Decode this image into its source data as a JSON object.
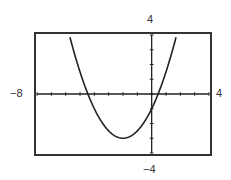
{
  "chart_data": {
    "type": "line",
    "title": "",
    "xlabel": "",
    "ylabel": "",
    "xlim": [
      -8,
      4
    ],
    "ylim": [
      -4,
      4
    ],
    "xscale_tick": 1,
    "yscale_tick": 1,
    "grid": false,
    "legend": null,
    "window_labels": {
      "ymax": "4",
      "ymin": "-4",
      "xmin": "-8",
      "xmax": "4"
    },
    "series": [
      {
        "name": "parabola",
        "equation_estimate": "y = 0.5x^2 + 2x - 1",
        "vertex": [
          -2,
          -3
        ],
        "x_intercepts": [
          -4.45,
          0.45
        ],
        "y_intercept": -1
      }
    ]
  },
  "labels": {
    "ymax": "4",
    "ymin": "−4",
    "xmin": "−8",
    "xmax": "4"
  },
  "colors": {
    "frame": "#333333",
    "axis": "#222222",
    "curve": "#222222"
  }
}
